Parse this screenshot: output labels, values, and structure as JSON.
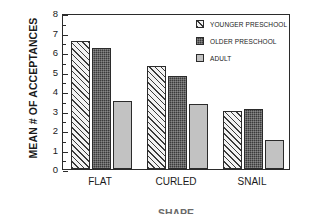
{
  "chart_data": {
    "type": "bar",
    "title": "",
    "xlabel": "SHAPE",
    "ylabel": "MEAN # OF ACCEPTANCES",
    "categories": [
      "FLAT",
      "CURLED",
      "SNAIL"
    ],
    "series": [
      {
        "name": "YOUNGER PRESCHOOL",
        "values": [
          6.55,
          5.3,
          3.0
        ],
        "swatch": "hatch"
      },
      {
        "name": "OLDER PRESCHOOL",
        "values": [
          6.2,
          4.75,
          3.1
        ],
        "swatch": "dark"
      },
      {
        "name": "ADULT",
        "values": [
          3.5,
          3.35,
          1.5
        ],
        "swatch": "gray"
      }
    ],
    "ylim": [
      0,
      8
    ],
    "yticks": [
      0,
      1,
      2,
      3,
      4,
      5,
      6,
      7,
      8
    ],
    "ytick_labels": [
      "0",
      "1",
      "2",
      "3",
      "4",
      "5",
      "6",
      "7",
      "8"
    ],
    "grid": false,
    "legend_position": "top-right",
    "colors": {
      "axis": "#2b2b2b",
      "series_hatch": "#f2f2f2",
      "series_dark": "#3b3b3b",
      "series_gray": "#c2c2c2",
      "background": "#ffffff"
    }
  }
}
